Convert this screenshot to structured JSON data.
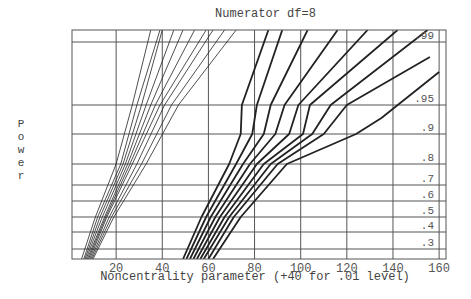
{
  "chart_data": {
    "type": "line",
    "title": "Numerator df=8",
    "xlabel": "Noncentrality parameter (+40 for .01 level)",
    "ylabel": "Power",
    "xlim": [
      0,
      165
    ],
    "x_ticks": [
      20,
      40,
      60,
      80,
      100,
      120,
      140,
      160
    ],
    "y_ticks": [
      0.3,
      0.4,
      0.5,
      0.6,
      0.7,
      0.8,
      0.9,
      0.95,
      0.99
    ],
    "y_tick_labels": [
      ".3",
      ".4",
      ".5",
      ".6",
      ".7",
      ".8",
      ".9",
      ".95",
      ".99"
    ],
    "grid": true,
    "legend": null,
    "series_groups": [
      {
        "name": "alpha .05 (thin curves)",
        "style": "thin",
        "series": [
          {
            "name": "c1",
            "points": [
              [
                5,
                0.25
              ],
              [
                11,
                0.5
              ],
              [
                20,
                0.8
              ],
              [
                27,
                0.95
              ],
              [
                35,
                0.995
              ]
            ]
          },
          {
            "name": "c2",
            "points": [
              [
                6,
                0.25
              ],
              [
                12,
                0.5
              ],
              [
                22,
                0.8
              ],
              [
                29,
                0.95
              ],
              [
                39,
                0.995
              ]
            ]
          },
          {
            "name": "c3",
            "points": [
              [
                6.5,
                0.25
              ],
              [
                13,
                0.5
              ],
              [
                23,
                0.8
              ],
              [
                31,
                0.95
              ],
              [
                40,
                0.995
              ]
            ]
          },
          {
            "name": "c4",
            "points": [
              [
                7,
                0.25
              ],
              [
                14,
                0.5
              ],
              [
                24,
                0.8
              ],
              [
                33,
                0.95
              ],
              [
                45,
                0.995
              ]
            ]
          },
          {
            "name": "c5",
            "points": [
              [
                7.5,
                0.25
              ],
              [
                15,
                0.5
              ],
              [
                25,
                0.8
              ],
              [
                35,
                0.95
              ],
              [
                49,
                0.995
              ]
            ]
          },
          {
            "name": "c6",
            "points": [
              [
                8,
                0.25
              ],
              [
                15.5,
                0.5
              ],
              [
                26,
                0.8
              ],
              [
                37,
                0.95
              ],
              [
                54,
                0.995
              ]
            ]
          },
          {
            "name": "c7",
            "points": [
              [
                8.5,
                0.25
              ],
              [
                16,
                0.5
              ],
              [
                27,
                0.8
              ],
              [
                39,
                0.95
              ],
              [
                59,
                0.995
              ]
            ]
          },
          {
            "name": "c8",
            "points": [
              [
                9,
                0.25
              ],
              [
                17,
                0.5
              ],
              [
                29,
                0.8
              ],
              [
                41,
                0.95
              ],
              [
                62,
                0.995
              ]
            ]
          },
          {
            "name": "c9",
            "points": [
              [
                9.5,
                0.25
              ],
              [
                18,
                0.5
              ],
              [
                31,
                0.8
              ],
              [
                44,
                0.95
              ],
              [
                67,
                0.995
              ]
            ]
          },
          {
            "name": "c10",
            "points": [
              [
                10,
                0.25
              ],
              [
                19,
                0.5
              ],
              [
                33,
                0.8
              ],
              [
                47,
                0.95
              ],
              [
                72,
                0.995
              ]
            ]
          }
        ]
      },
      {
        "name": "alpha .01 (bold curves)",
        "style": "bold",
        "series": [
          {
            "name": "d1",
            "points": [
              [
                49,
                0.25
              ],
              [
                57,
                0.5
              ],
              [
                69,
                0.8
              ],
              [
                74,
                0.9
              ],
              [
                74.5,
                0.95
              ],
              [
                86,
                0.995
              ]
            ]
          },
          {
            "name": "d2",
            "points": [
              [
                50.5,
                0.25
              ],
              [
                59,
                0.5
              ],
              [
                72,
                0.8
              ],
              [
                79,
                0.9
              ],
              [
                81,
                0.95
              ],
              [
                92,
                0.995
              ]
            ]
          },
          {
            "name": "d3",
            "points": [
              [
                52,
                0.25
              ],
              [
                61,
                0.5
              ],
              [
                75,
                0.8
              ],
              [
                84,
                0.9
              ],
              [
                87,
                0.95
              ],
              [
                103,
                0.995
              ]
            ]
          },
          {
            "name": "d4",
            "points": [
              [
                53.5,
                0.25
              ],
              [
                63,
                0.5
              ],
              [
                78,
                0.8
              ],
              [
                89,
                0.9
              ],
              [
                93,
                0.95
              ],
              [
                116,
                0.995
              ]
            ]
          },
          {
            "name": "d5",
            "points": [
              [
                55,
                0.25
              ],
              [
                65,
                0.5
              ],
              [
                81,
                0.8
              ],
              [
                95,
                0.9
              ],
              [
                99,
                0.95
              ],
              [
                129,
                0.995
              ]
            ]
          },
          {
            "name": "d6",
            "points": [
              [
                56.5,
                0.25
              ],
              [
                67,
                0.5
              ],
              [
                84,
                0.8
              ],
              [
                101,
                0.9
              ],
              [
                104,
                0.95
              ],
              [
                142,
                0.995
              ]
            ]
          },
          {
            "name": "d7",
            "points": [
              [
                58,
                0.25
              ],
              [
                69,
                0.5
              ],
              [
                87,
                0.8
              ],
              [
                105,
                0.9
              ],
              [
                113,
                0.95
              ],
              [
                155,
                0.995
              ]
            ]
          },
          {
            "name": "d8",
            "points": [
              [
                60,
                0.25
              ],
              [
                71,
                0.5
              ],
              [
                90,
                0.8
              ],
              [
                110,
                0.9
              ],
              [
                120,
                0.95
              ],
              [
                156,
                0.985
              ]
            ]
          },
          {
            "name": "d9",
            "points": [
              [
                62,
                0.25
              ],
              [
                74,
                0.5
              ],
              [
                94,
                0.8
              ],
              [
                124,
                0.9
              ],
              [
                135,
                0.93
              ],
              [
                160,
                0.975
              ]
            ]
          }
        ]
      }
    ]
  },
  "layout": {
    "plot": {
      "left": 72,
      "right": 446,
      "top": 30,
      "bottom": 259
    },
    "x_origin_px": 70,
    "px_per_unit": 2.307,
    "power_y_px": {
      "0.25": 259,
      "0.3": 249,
      "0.4": 232,
      "0.5": 217,
      "0.6": 201,
      "0.7": 185,
      "0.8": 164,
      "0.9": 134,
      "0.93": 118,
      "0.95": 105,
      "0.975": 72,
      "0.985": 57,
      "0.99": 42,
      "0.995": 30
    }
  },
  "title": "Numerator df=8",
  "xlabel": "Noncentrality parameter (+40 for .01 level)",
  "ylabel_letters": [
    "P",
    "o",
    "w",
    "e",
    "r"
  ]
}
